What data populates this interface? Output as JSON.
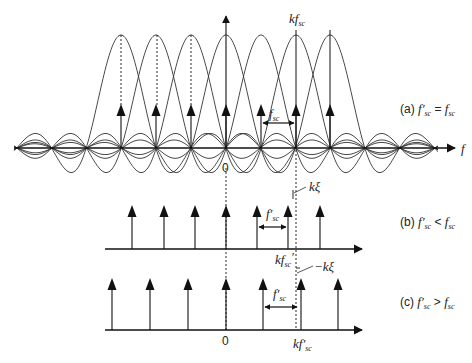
{
  "panels": {
    "a": {
      "label": "(a)",
      "condition_lhs": "f′",
      "condition_lhs_sub": "sc",
      "condition_op": " = ",
      "condition_rhs": "f",
      "condition_rhs_sub": "sc",
      "axis_label": "f",
      "origin_label": "0",
      "peak_label_prefix": "kf",
      "peak_label_sub": "sc",
      "spacing_label": "f",
      "spacing_label_sub": "sc",
      "subcarrier_count": 7
    },
    "b": {
      "label": "(b)",
      "condition_lhs": "f′",
      "condition_lhs_sub": "sc",
      "condition_op": " < ",
      "condition_rhs": "f",
      "condition_rhs_sub": "sc",
      "offset_label": "kξ",
      "spacing_label": "f′",
      "spacing_label_sub": "sc",
      "peak_label_prefix": "kf",
      "peak_label_sub": "sc",
      "peak_label_prime": "′"
    },
    "c": {
      "label": "(c)",
      "condition_lhs": "f′",
      "condition_lhs_sub": "sc",
      "condition_op": " > ",
      "condition_rhs": "f",
      "condition_rhs_sub": "sc",
      "offset_label": "−kξ",
      "spacing_label": "f′",
      "spacing_label_sub": "sc",
      "origin_label": "0",
      "peak_label_prefix": "kf′",
      "peak_label_sub": "sc"
    }
  }
}
